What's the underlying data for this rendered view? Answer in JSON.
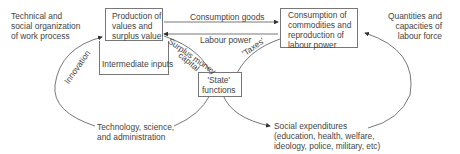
{
  "diagram": {
    "boxes": {
      "production": "Production of\nvalues and\nsurplus value",
      "intermediate": "Intermediate inputs",
      "consumption": "Consumption of\ncommodities and\nreproduction of\nlabour power",
      "state": "'State'\nfunctions"
    },
    "labels": {
      "technical": "Technical and\nsocial organization\nof work process",
      "quantities": "Quantities and\ncapacities of\nlabour force",
      "consumption_goods": "Consumption goods",
      "labour_power": "Labour power",
      "surplus_money": "Surplus money",
      "capital": "capital",
      "taxes": "'Taxes'",
      "innovation": "Innovation",
      "technology": "Technology, science,\nand administration",
      "social_expenditures": "Social expenditures\n(education, health, welfare,\nideology, police, military, etc)"
    }
  }
}
